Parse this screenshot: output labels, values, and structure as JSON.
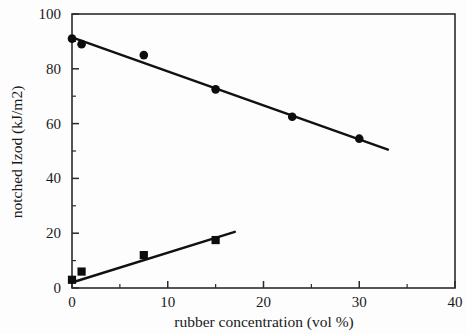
{
  "chart_data": {
    "type": "scatter",
    "title": "",
    "xlabel": "rubber concentration (vol %)",
    "ylabel": "notched Izod  (kJ/m2)",
    "xlim": [
      0,
      40
    ],
    "ylim": [
      0,
      100
    ],
    "grid": false,
    "legend": "none",
    "x_major_ticks": [
      0,
      10,
      20,
      30,
      40
    ],
    "x_minor_ticks": [
      5,
      15,
      25,
      35
    ],
    "y_major_ticks": [
      0,
      20,
      40,
      60,
      80,
      100
    ],
    "y_minor_ticks": [
      10,
      30,
      50,
      70,
      90
    ],
    "x_tick_labels": [
      "0",
      "10",
      "20",
      "30",
      "40"
    ],
    "y_tick_labels": [
      "0",
      "20",
      "40",
      "60",
      "80",
      "100"
    ],
    "series": [
      {
        "name": "upper-series-circles",
        "marker": "circle",
        "color": "#0d0d0d",
        "x": [
          0,
          1,
          7.5,
          15,
          23,
          30
        ],
        "y": [
          91,
          89,
          85,
          72.5,
          62.5,
          54.5
        ],
        "fit_line": {
          "x": [
            0,
            33
          ],
          "y": [
            91.5,
            50.5
          ]
        }
      },
      {
        "name": "lower-series-squares",
        "marker": "square",
        "color": "#0d0d0d",
        "x": [
          0,
          1,
          7.5,
          15
        ],
        "y": [
          3,
          6,
          12,
          17.5
        ],
        "fit_line": {
          "x": [
            0,
            17
          ],
          "y": [
            2,
            20.5
          ]
        }
      }
    ]
  },
  "axes": {
    "x_axis_title": "rubber concentration (vol %)",
    "y_axis_title": "notched Izod  (kJ/m2)"
  }
}
